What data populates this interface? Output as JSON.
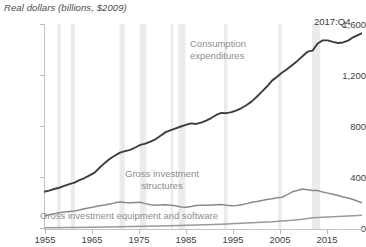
{
  "chart_data": {
    "type": "line",
    "title": "",
    "subtitle": "",
    "ylabel": "Real dollars (billions, $2009)",
    "xlabel": "",
    "ylim": [
      0,
      1600
    ],
    "xlim": [
      1955,
      2017.75
    ],
    "grid": false,
    "legend_position": "inline-annotations",
    "ytick_labels": [
      "0",
      "400",
      "800",
      "1,200",
      "1,600"
    ],
    "ytick_values": [
      0,
      400,
      800,
      1200,
      1600
    ],
    "xtick_labels": [
      "1955",
      "1965",
      "1975",
      "1985",
      "1995",
      "2005",
      "2015"
    ],
    "xtick_values": [
      1955,
      1965,
      1975,
      1985,
      1995,
      2005,
      2015
    ],
    "annotations": [
      {
        "name": "consumption-label",
        "text": "Consumption\nexpenditures",
        "line1": "Consumption",
        "line2": "expenditures"
      },
      {
        "name": "structures-label",
        "text": "Gross investment\nstructures",
        "line1": "Gross investment",
        "line2": "structures"
      },
      {
        "name": "equipment-label",
        "text": "Gross investment equipment and software"
      },
      {
        "name": "last-point-label",
        "text": "2017:Q4"
      }
    ],
    "recession_bands": [
      {
        "start": 1957.6,
        "end": 1958.3
      },
      {
        "start": 1960.3,
        "end": 1961.1
      },
      {
        "start": 1969.9,
        "end": 1970.9
      },
      {
        "start": 1973.9,
        "end": 1975.2
      },
      {
        "start": 1980.0,
        "end": 1980.5
      },
      {
        "start": 1981.5,
        "end": 1982.9
      },
      {
        "start": 1990.5,
        "end": 1991.2
      },
      {
        "start": 2001.2,
        "end": 2001.9
      },
      {
        "start": 2007.9,
        "end": 2009.5
      }
    ],
    "colors": {
      "consumption": "#3d3d3d",
      "structures": "#8a8a8a",
      "equipment": "#9a9a9a",
      "recession_band": "#ebebeb",
      "axis": "#c4c4c4",
      "label_gray": "#8d8d8d",
      "text": "#3f3f3f"
    },
    "series": [
      {
        "name": "Consumption expenditures",
        "color": "#3d3d3d",
        "x": [
          1955,
          1956,
          1957,
          1958,
          1959,
          1960,
          1961,
          1962,
          1963,
          1964,
          1965,
          1966,
          1967,
          1968,
          1969,
          1970,
          1971,
          1972,
          1973,
          1974,
          1975,
          1976,
          1977,
          1978,
          1979,
          1980,
          1981,
          1982,
          1983,
          1984,
          1985,
          1986,
          1987,
          1988,
          1989,
          1990,
          1991,
          1992,
          1993,
          1994,
          1995,
          1996,
          1997,
          1998,
          1999,
          2000,
          2001,
          2002,
          2003,
          2004,
          2005,
          2006,
          2007,
          2008,
          2009,
          2010,
          2011,
          2012,
          2013,
          2014,
          2015,
          2016,
          2017.75
        ],
        "values": [
          290,
          300,
          312,
          322,
          336,
          350,
          362,
          382,
          398,
          418,
          440,
          480,
          516,
          548,
          574,
          596,
          608,
          618,
          636,
          656,
          666,
          682,
          700,
          728,
          756,
          772,
          786,
          800,
          812,
          824,
          820,
          830,
          846,
          866,
          890,
          906,
          904,
          912,
          926,
          944,
          968,
          996,
          1032,
          1072,
          1112,
          1158,
          1188,
          1222,
          1248,
          1280,
          1312,
          1348,
          1384,
          1392,
          1448,
          1472,
          1472,
          1460,
          1452,
          1456,
          1470,
          1496,
          1528
        ]
      },
      {
        "name": "Gross investment structures",
        "color": "#8a8a8a",
        "x": [
          1955,
          1956,
          1957,
          1958,
          1959,
          1960,
          1961,
          1962,
          1963,
          1964,
          1965,
          1966,
          1967,
          1968,
          1969,
          1970,
          1971,
          1972,
          1973,
          1974,
          1975,
          1976,
          1977,
          1978,
          1979,
          1980,
          1981,
          1982,
          1983,
          1984,
          1985,
          1986,
          1987,
          1988,
          1989,
          1990,
          1991,
          1992,
          1993,
          1994,
          1995,
          1996,
          1997,
          1998,
          1999,
          2000,
          2001,
          2002,
          2003,
          2004,
          2005,
          2006,
          2007,
          2008,
          2009,
          2010,
          2011,
          2012,
          2013,
          2014,
          2015,
          2016,
          2017.75
        ],
        "values": [
          104,
          112,
          120,
          126,
          132,
          136,
          140,
          148,
          158,
          166,
          174,
          182,
          188,
          196,
          204,
          210,
          206,
          204,
          206,
          208,
          198,
          190,
          186,
          188,
          190,
          186,
          182,
          172,
          170,
          176,
          184,
          186,
          186,
          188,
          190,
          192,
          186,
          182,
          184,
          190,
          198,
          208,
          214,
          222,
          230,
          236,
          244,
          248,
          268,
          290,
          300,
          312,
          306,
          300,
          300,
          288,
          280,
          272,
          262,
          250,
          242,
          230,
          204
        ]
      },
      {
        "name": "Gross investment equipment and software",
        "color": "#9a9a9a",
        "x": [
          1955,
          1960,
          1965,
          1970,
          1975,
          1980,
          1985,
          1990,
          1995,
          2000,
          2002,
          2004,
          2006,
          2008,
          2010,
          2012,
          2014,
          2016,
          2017.75
        ],
        "values": [
          10,
          12,
          14,
          18,
          22,
          26,
          32,
          38,
          46,
          56,
          62,
          68,
          76,
          88,
          92,
          96,
          100,
          104,
          108
        ]
      }
    ]
  }
}
